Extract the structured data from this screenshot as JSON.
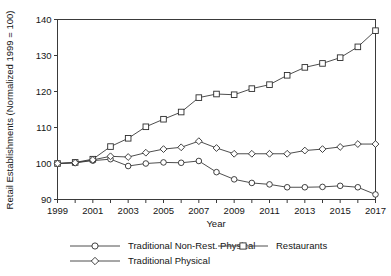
{
  "chart_data": {
    "type": "line",
    "title": "",
    "xlabel": "Year",
    "ylabel": "Retail Establishments (Normalized 1999 = 100)",
    "x": [
      1999,
      2000,
      2001,
      2002,
      2003,
      2004,
      2005,
      2006,
      2007,
      2008,
      2009,
      2010,
      2011,
      2012,
      2013,
      2014,
      2015,
      2016,
      2017
    ],
    "xlim": [
      1999,
      2017
    ],
    "ylim": [
      90,
      140
    ],
    "xticks": [
      1999,
      2000,
      2001,
      2002,
      2003,
      2004,
      2005,
      2006,
      2007,
      2008,
      2009,
      2010,
      2011,
      2012,
      2013,
      2014,
      2015,
      2016,
      2017
    ],
    "xtick_labels": [
      "1999",
      "",
      "2001",
      "",
      "2003",
      "",
      "2005",
      "",
      "2007",
      "",
      "2009",
      "",
      "2011",
      "",
      "2013",
      "",
      "2015",
      "",
      "2017"
    ],
    "yticks": [
      90,
      100,
      110,
      120,
      130,
      140
    ],
    "ytick_labels": [
      "90",
      "100",
      "110",
      "120",
      "130",
      "140"
    ],
    "grid": false,
    "legend_position": "below",
    "series": [
      {
        "name": "Traditional Non-Rest. Physical",
        "marker": "circle",
        "values": [
          100.0,
          100.2,
          100.8,
          101.2,
          99.3,
          100.0,
          100.3,
          100.2,
          100.7,
          97.6,
          95.6,
          94.6,
          94.2,
          93.4,
          93.4,
          93.5,
          93.8,
          93.4,
          91.4
        ]
      },
      {
        "name": "Restaurants",
        "marker": "square",
        "values": [
          100.0,
          100.3,
          101.2,
          104.7,
          107.0,
          110.2,
          112.3,
          114.3,
          118.3,
          119.3,
          119.1,
          120.8,
          121.9,
          124.5,
          126.7,
          127.8,
          129.4,
          132.4,
          136.9
        ]
      },
      {
        "name": "Traditional Physical",
        "marker": "diamond",
        "values": [
          100.0,
          100.2,
          101.0,
          102.0,
          101.8,
          103.0,
          104.0,
          104.5,
          106.2,
          104.3,
          102.7,
          102.7,
          102.7,
          102.7,
          103.6,
          104.0,
          104.6,
          105.4,
          105.4
        ]
      }
    ]
  },
  "legend": {
    "items": [
      {
        "label": "Traditional Non-Rest. Physical",
        "marker": "circle"
      },
      {
        "label": "Restaurants",
        "marker": "square"
      },
      {
        "label": "Traditional Physical",
        "marker": "diamond"
      }
    ]
  }
}
